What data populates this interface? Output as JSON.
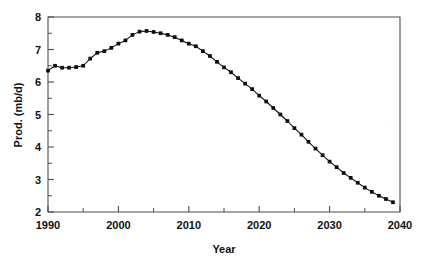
{
  "chart_data": {
    "type": "line",
    "title": "",
    "subtitle": "",
    "xlabel": "Year",
    "ylabel": "Prod. (mb/d)",
    "xlim": [
      1990,
      2040
    ],
    "ylim": [
      2,
      8
    ],
    "x_major_ticks": [
      1990,
      2000,
      2010,
      2020,
      2030,
      2040
    ],
    "x_major_tick_labels": [
      "1990",
      "2000",
      "2010",
      "2020",
      "2030",
      "2040"
    ],
    "x_minor_ticks": [
      1995,
      2005,
      2015,
      2025,
      2035
    ],
    "y_major_ticks": [
      2,
      3,
      4,
      5,
      6,
      7,
      8
    ],
    "y_major_tick_labels": [
      "2",
      "3",
      "4",
      "5",
      "6",
      "7",
      "8"
    ],
    "y_minor_ticks": [
      2.5,
      3.5,
      4.5,
      5.5,
      6.5,
      7.5
    ],
    "grid": false,
    "legend": null,
    "legend_position": "none",
    "marker": "square",
    "line_color": "#0b0b0b",
    "marker_color": "#0b0b0b",
    "background_color": "#ffffff",
    "annotations": [],
    "series": [
      {
        "name": "Production",
        "x": [
          1990,
          1991,
          1992,
          1993,
          1994,
          1995,
          1996,
          1997,
          1998,
          1999,
          2000,
          2001,
          2002,
          2003,
          2004,
          2005,
          2006,
          2007,
          2008,
          2009,
          2010,
          2011,
          2012,
          2013,
          2014,
          2015,
          2016,
          2017,
          2018,
          2019,
          2020,
          2021,
          2022,
          2023,
          2024,
          2025,
          2026,
          2027,
          2028,
          2029,
          2030,
          2031,
          2032,
          2033,
          2034,
          2035,
          2036,
          2037,
          2038,
          2039
        ],
        "values": [
          6.35,
          6.5,
          6.44,
          6.44,
          6.46,
          6.5,
          6.72,
          6.9,
          6.95,
          7.05,
          7.18,
          7.28,
          7.45,
          7.55,
          7.57,
          7.54,
          7.5,
          7.45,
          7.38,
          7.28,
          7.18,
          7.1,
          6.95,
          6.8,
          6.62,
          6.45,
          6.3,
          6.12,
          5.95,
          5.78,
          5.58,
          5.4,
          5.2,
          5.0,
          4.8,
          4.58,
          4.38,
          4.16,
          3.95,
          3.75,
          3.55,
          3.38,
          3.2,
          3.05,
          2.9,
          2.75,
          2.62,
          2.5,
          2.4,
          2.3
        ]
      }
    ]
  }
}
